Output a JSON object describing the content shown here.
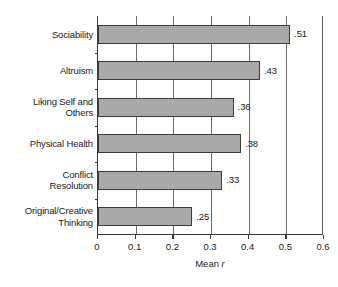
{
  "chart_data": {
    "type": "bar",
    "orientation": "horizontal",
    "title": "",
    "xlabel": "Mean r",
    "ylabel": "",
    "xlim": [
      0,
      0.6
    ],
    "xticks": [
      "0",
      "0.1",
      "0.2",
      "0.3",
      "0.4",
      "0.5",
      "0.6"
    ],
    "xtick_values": [
      0,
      0.1,
      0.2,
      0.3,
      0.4,
      0.5,
      0.6
    ],
    "grid": "vertical",
    "legend": "none",
    "categories": [
      "Sociability",
      "Altruism",
      "Liking Self and Others",
      "Physical Health",
      "Conflict Resolution",
      "Original/Creative Thinking"
    ],
    "values": [
      0.51,
      0.43,
      0.36,
      0.38,
      0.33,
      0.25
    ],
    "data_labels": [
      ".51",
      ".43",
      ".36",
      ".38",
      ".33",
      ".25"
    ],
    "bar_color": "#a9a9a9",
    "bar_edge_color": "#3d3d3d",
    "axis_color": "#3a3a3a"
  },
  "axis": {
    "title_prefix": "Mean ",
    "title_italic": "r"
  },
  "bars": [
    {
      "label_line1": "Sociability",
      "label_line2": "",
      "value": 0.51,
      "data_label": ".51"
    },
    {
      "label_line1": "Altruism",
      "label_line2": "",
      "value": 0.43,
      "data_label": ".43"
    },
    {
      "label_line1": "Liking Self and",
      "label_line2": "Others",
      "value": 0.36,
      "data_label": ".36"
    },
    {
      "label_line1": "Physical Health",
      "label_line2": "",
      "value": 0.38,
      "data_label": ".38"
    },
    {
      "label_line1": "Conflict",
      "label_line2": "Resolution",
      "value": 0.33,
      "data_label": ".33"
    },
    {
      "label_line1": "Original/Creative",
      "label_line2": "Thinking",
      "value": 0.25,
      "data_label": ".25"
    }
  ],
  "xticks": [
    {
      "label": "0",
      "value": 0
    },
    {
      "label": "0.1",
      "value": 0.1
    },
    {
      "label": "0.2",
      "value": 0.2
    },
    {
      "label": "0.3",
      "value": 0.3
    },
    {
      "label": "0.4",
      "value": 0.4
    },
    {
      "label": "0.5",
      "value": 0.5
    },
    {
      "label": "0.6",
      "value": 0.6
    }
  ]
}
